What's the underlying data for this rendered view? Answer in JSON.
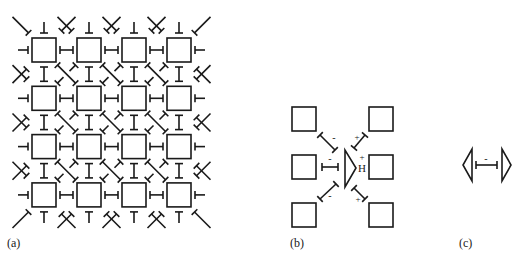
{
  "figure": {
    "stroke_color": "#1a1a1a",
    "background": "#ffffff",
    "panels": [
      {
        "id": "a",
        "label": "(a)",
        "description": "4x4 lattice of squares connected by bond symbols",
        "grid": {
          "rows": 4,
          "cols": 4,
          "x0": 32,
          "y0": 38,
          "pitch_x": 45,
          "pitch_y": 48.3,
          "square_size": 24
        }
      },
      {
        "id": "b",
        "label": "(b)",
        "description": "Six squares around a central triangle with signed bonds",
        "signs": {
          "upper_left": "-",
          "middle_left": "-",
          "lower_left": "-",
          "upper_right": "+",
          "lower_right": "+",
          "center_mark": "+",
          "center_letter": "H"
        }
      },
      {
        "id": "c",
        "label": "(c)",
        "description": "Two opposing triangles joined by a bond",
        "sign": "-"
      }
    ]
  }
}
